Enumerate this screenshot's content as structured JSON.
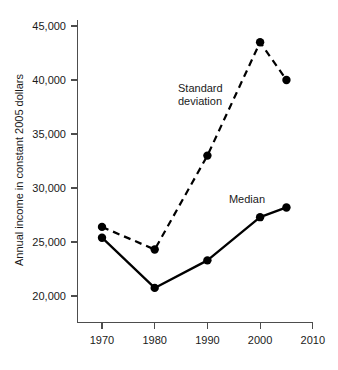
{
  "chart_data": {
    "type": "line",
    "title": "",
    "subtitle": "",
    "xlabel": "",
    "ylabel": "Annual income in constant 2005 dollars",
    "xlim": [
      1965,
      2010
    ],
    "ylim": [
      18500,
      45800
    ],
    "xticks": [
      1970,
      1980,
      1990,
      2000,
      2010
    ],
    "xticklabels": [
      "1970",
      "1980",
      "1990",
      "2000",
      "2010"
    ],
    "yticks": [
      20000,
      25000,
      30000,
      35000,
      40000,
      45000
    ],
    "yticklabels": [
      "20,000",
      "25,000",
      "30,000",
      "35,000",
      "40,000",
      "45,000"
    ],
    "grid": false,
    "legend_position": "inline-annotations",
    "x": [
      1970,
      1980,
      1990,
      2000,
      2005
    ],
    "series": [
      {
        "name": "Standard deviation",
        "style": "dashed",
        "marker": "filled-circle",
        "color": "#000000",
        "values": [
          26400,
          24300,
          33000,
          43500,
          40000
        ]
      },
      {
        "name": "Median",
        "style": "solid",
        "marker": "filled-circle",
        "color": "#000000",
        "values": [
          25400,
          20750,
          23300,
          27300,
          28200
        ]
      }
    ],
    "annotations": [
      {
        "name": "standard-deviation-label",
        "lines": [
          "Standard",
          "deviation"
        ],
        "x": 1988.5,
        "y": 39200,
        "align": "start"
      },
      {
        "name": "median-label",
        "lines": [
          "Median"
        ],
        "x": 2001.5,
        "y": 29400,
        "align": "end"
      }
    ]
  },
  "axes": {
    "y_axis_name": "y-axis",
    "x_axis_name": "x-axis"
  }
}
